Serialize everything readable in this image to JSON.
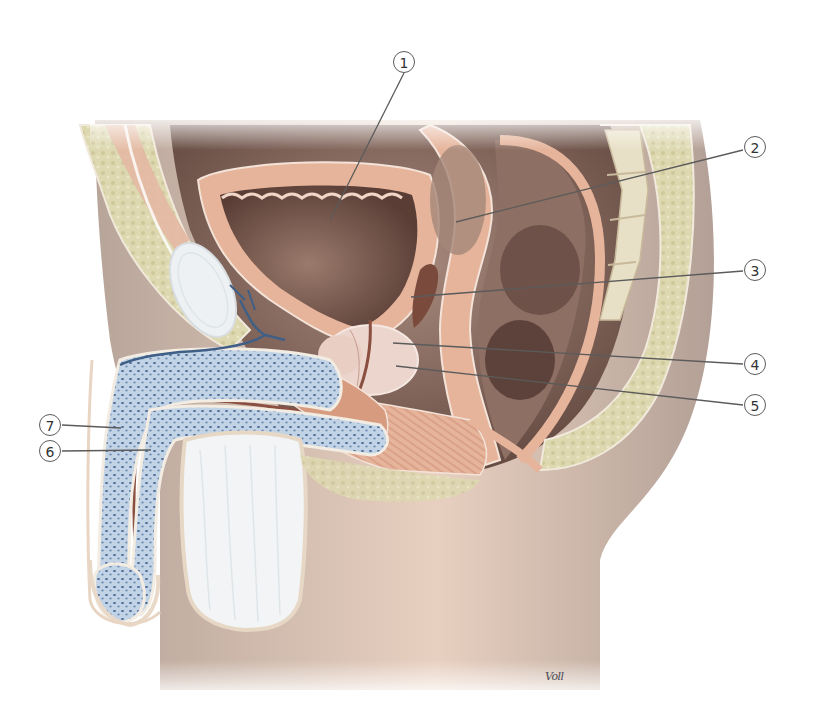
{
  "figure": {
    "type": "anatomical illustration",
    "view": "midsagittal section, male pelvis",
    "signature": "Voll"
  },
  "callouts": [
    {
      "label": "1",
      "x": 404,
      "y": 62,
      "line": [
        [
          404,
          73
        ],
        [
          330,
          220
        ]
      ]
    },
    {
      "label": "2",
      "x": 755,
      "y": 147,
      "line": [
        [
          743,
          150
        ],
        [
          456,
          222
        ]
      ]
    },
    {
      "label": "3",
      "x": 755,
      "y": 270,
      "line": [
        [
          743,
          271
        ],
        [
          411,
          297
        ]
      ]
    },
    {
      "label": "4",
      "x": 755,
      "y": 364,
      "line": [
        [
          743,
          364
        ],
        [
          393,
          343
        ]
      ]
    },
    {
      "label": "5",
      "x": 755,
      "y": 405,
      "line": [
        [
          743,
          405
        ],
        [
          396,
          366
        ]
      ]
    },
    {
      "label": "7",
      "x": 50,
      "y": 425,
      "line": [
        [
          62,
          425
        ],
        [
          121,
          428
        ]
      ]
    },
    {
      "label": "6",
      "x": 50,
      "y": 451,
      "line": [
        [
          62,
          451
        ],
        [
          151,
          450
        ]
      ]
    }
  ],
  "colors": {
    "skin": "#b8a59a",
    "skin_light": "#e6cdbd",
    "bone_yellow": "#ddd8b0",
    "muscle": "#e6b49b",
    "muscle_dark": "#c98f78",
    "cavity_dark": "#6f534b",
    "cavity_mid": "#9b7c70",
    "erectile_blue": "#b9cce0",
    "erectile_dots": "#4c6f9a",
    "white_tissue": "#f2f4f5",
    "prostate": "#ead2c9",
    "line": "#5b5b5b"
  }
}
